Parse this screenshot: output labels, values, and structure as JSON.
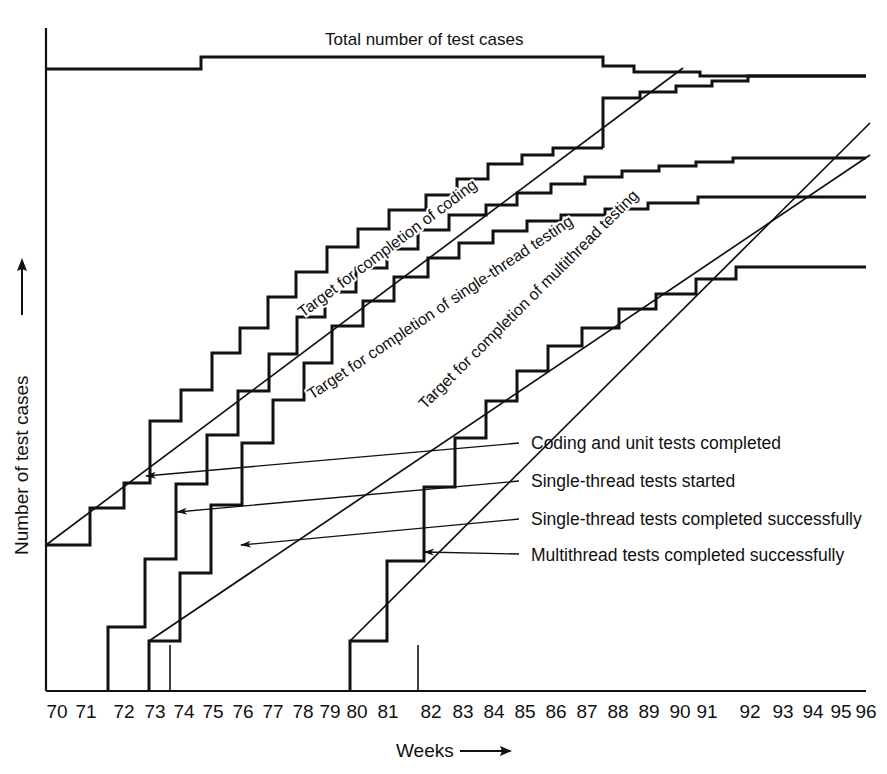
{
  "chart_data": {
    "type": "line",
    "title": "",
    "xlabel": "Weeks",
    "ylabel": "Number of test cases",
    "grid": false,
    "legend_position": "inline-right-with-leader-arrows",
    "xlim": [
      70,
      96
    ],
    "ylim": [
      0,
      105
    ],
    "x_tick_labels": [
      "70",
      "71",
      "72",
      "73",
      "74",
      "75",
      "76",
      "77",
      "78",
      "79",
      "80",
      "81",
      "82",
      "83",
      "84",
      "85",
      "86",
      "87",
      "88",
      "89",
      "90",
      "91",
      "92",
      "93",
      "94",
      "95",
      "96"
    ],
    "x_ticks": [
      70,
      71,
      72,
      73,
      74,
      75,
      76,
      77,
      78,
      79,
      80,
      81,
      82,
      83,
      84,
      85,
      86,
      87,
      88,
      89,
      90,
      91,
      92,
      93,
      94,
      95,
      96
    ],
    "y_tick_labels": [],
    "annotations": [
      {
        "name": "total-line-label",
        "text": "Total number of test cases"
      },
      {
        "name": "target-coding-label",
        "text": "Target for completion of coding"
      },
      {
        "name": "target-single-thread-label",
        "text": "Target for completion of single-thread testing"
      },
      {
        "name": "target-multithread-label",
        "text": "Target for completion of multithread testing"
      }
    ],
    "series": [
      {
        "name": "Total number of test cases",
        "style": "step",
        "points": [
          [
            70,
            88
          ],
          [
            75,
            96
          ],
          [
            75,
            96
          ],
          [
            87,
            96
          ],
          [
            87,
            91
          ],
          [
            88,
            91
          ],
          [
            88.6,
            88.5
          ],
          [
            91,
            88.5
          ],
          [
            91,
            86.5
          ],
          [
            96,
            86.5
          ]
        ]
      },
      {
        "name": "Coding and unit tests completed",
        "style": "step",
        "points": [
          [
            70,
            32
          ],
          [
            71.4,
            32
          ],
          [
            71.4,
            38
          ],
          [
            72.5,
            38
          ],
          [
            72.5,
            42
          ],
          [
            73.3,
            42
          ],
          [
            73.3,
            52
          ],
          [
            74.3,
            52
          ],
          [
            74.3,
            57
          ],
          [
            75.3,
            57
          ],
          [
            75.3,
            63
          ],
          [
            76.2,
            63
          ],
          [
            76.2,
            67
          ],
          [
            77.1,
            67
          ],
          [
            77.1,
            72
          ],
          [
            78.0,
            72
          ],
          [
            78.0,
            76
          ],
          [
            79.0,
            76
          ],
          [
            79.0,
            80
          ],
          [
            80.0,
            80
          ],
          [
            80.0,
            83
          ],
          [
            81.0,
            83
          ],
          [
            81.0,
            86
          ],
          [
            82.2,
            86
          ],
          [
            82.2,
            88.5
          ],
          [
            83.2,
            88.5
          ],
          [
            83.2,
            91
          ],
          [
            84.2,
            91
          ],
          [
            84.2,
            93.5
          ],
          [
            85.3,
            93.5
          ],
          [
            85.3,
            95
          ],
          [
            86.3,
            95
          ],
          [
            86.3,
            96
          ],
          [
            88.6,
            96
          ],
          [
            88.6,
            88.6
          ],
          [
            96,
            88.6
          ]
        ]
      },
      {
        "name": "Single-thread tests started",
        "style": "step",
        "points": [
          [
            72,
            0
          ],
          [
            72,
            20
          ],
          [
            73.2,
            20
          ],
          [
            73.2,
            31
          ],
          [
            74.2,
            31
          ],
          [
            74.2,
            43
          ],
          [
            75.2,
            43
          ],
          [
            75.2,
            51
          ],
          [
            76.2,
            51
          ],
          [
            76.2,
            58
          ],
          [
            77.2,
            58
          ],
          [
            77.2,
            64
          ],
          [
            78.1,
            64
          ],
          [
            78.1,
            70
          ],
          [
            79.0,
            70
          ],
          [
            79.0,
            74
          ],
          [
            80.0,
            74
          ],
          [
            80.0,
            78
          ],
          [
            81.0,
            78
          ],
          [
            81.0,
            81
          ],
          [
            82.0,
            81
          ],
          [
            82.0,
            84
          ],
          [
            83.0,
            84
          ],
          [
            83.0,
            86.5
          ],
          [
            84.2,
            86.5
          ],
          [
            84.2,
            88
          ],
          [
            85.2,
            88
          ],
          [
            85.2,
            90
          ],
          [
            86.3,
            90
          ],
          [
            86.3,
            91.5
          ],
          [
            87.4,
            91.5
          ],
          [
            87.4,
            92.5
          ],
          [
            88.6,
            92.5
          ],
          [
            88.6,
            93.5
          ],
          [
            89.8,
            93.5
          ],
          [
            89.8,
            94.3
          ],
          [
            91.0,
            94.3
          ],
          [
            91.0,
            95
          ],
          [
            96,
            95
          ]
        ]
      },
      {
        "name": "Single-thread tests completed successfully",
        "style": "step",
        "points": [
          [
            73.3,
            0
          ],
          [
            73.3,
            12
          ],
          [
            74.3,
            12
          ],
          [
            74.3,
            23
          ],
          [
            75.3,
            23
          ],
          [
            75.3,
            34
          ],
          [
            76.3,
            34
          ],
          [
            76.3,
            44
          ],
          [
            77.3,
            44
          ],
          [
            77.3,
            51
          ],
          [
            78.3,
            51
          ],
          [
            78.3,
            57
          ],
          [
            79.2,
            57
          ],
          [
            79.2,
            63
          ],
          [
            80.2,
            63
          ],
          [
            80.2,
            67
          ],
          [
            81.2,
            67
          ],
          [
            81.2,
            71
          ],
          [
            82.3,
            71
          ],
          [
            82.3,
            74
          ],
          [
            83.3,
            74
          ],
          [
            83.3,
            76.5
          ],
          [
            84.4,
            76.5
          ],
          [
            84.4,
            78.5
          ],
          [
            85.5,
            78.5
          ],
          [
            85.5,
            80
          ],
          [
            86.6,
            80
          ],
          [
            86.6,
            81
          ],
          [
            88.0,
            81
          ],
          [
            88.0,
            82
          ],
          [
            89.4,
            82
          ],
          [
            89.4,
            83
          ],
          [
            91.0,
            83
          ],
          [
            91.0,
            84
          ],
          [
            96,
            84
          ]
        ]
      },
      {
        "name": "Multithread tests completed successfully",
        "style": "step",
        "points": [
          [
            79.8,
            0
          ],
          [
            79.8,
            8
          ],
          [
            81.0,
            8
          ],
          [
            81.0,
            21
          ],
          [
            82.2,
            21
          ],
          [
            82.2,
            33
          ],
          [
            83.2,
            33
          ],
          [
            83.2,
            41
          ],
          [
            84.2,
            41
          ],
          [
            84.2,
            47
          ],
          [
            85.2,
            47
          ],
          [
            85.2,
            52
          ],
          [
            86.2,
            52
          ],
          [
            86.2,
            56
          ],
          [
            87.3,
            56
          ],
          [
            87.3,
            59
          ],
          [
            88.5,
            59
          ],
          [
            88.5,
            62
          ],
          [
            89.7,
            62
          ],
          [
            89.7,
            64.5
          ],
          [
            91.0,
            64.5
          ],
          [
            91.0,
            67
          ],
          [
            92.3,
            67
          ],
          [
            92.3,
            69
          ],
          [
            96,
            69
          ]
        ]
      }
    ],
    "target_lines": [
      {
        "name": "Target for completion of coding",
        "from": [
          70,
          32
        ],
        "to": [
          88.2,
          97
        ]
      },
      {
        "name": "Target for completion of single-thread testing",
        "from": [
          73.3,
          12
        ],
        "to": [
          96,
          78
        ]
      },
      {
        "name": "Target for completion of multithread testing",
        "from": [
          79.8,
          8
        ],
        "to": [
          96,
          76
        ]
      }
    ]
  },
  "axis": {
    "x_title": "Weeks",
    "y_title": "Number of test cases",
    "arrow_glyph": "arrow-right"
  },
  "top_label": {
    "text": "Total number of test cases"
  },
  "targets": [
    {
      "label": "Target for completion of coding"
    },
    {
      "label": "Target for completion of single-thread testing"
    },
    {
      "label": "Target for completion of multithread testing"
    }
  ],
  "legend": {
    "items": [
      {
        "label": "Coding and unit tests completed"
      },
      {
        "label": "Single-thread tests started"
      },
      {
        "label": "Single-thread tests completed successfully"
      },
      {
        "label": "Multithread tests completed successfully"
      }
    ]
  },
  "ticks": {
    "labels": [
      "70",
      "71",
      "72",
      "73",
      "74",
      "75",
      "76",
      "77",
      "78",
      "79",
      "80",
      "81",
      "82",
      "83",
      "84",
      "85",
      "86",
      "87",
      "88",
      "89",
      "90",
      "91",
      "92",
      "93",
      "94",
      "95",
      "96"
    ]
  },
  "colors": {
    "ink": "#111111",
    "background": "#ffffff"
  }
}
